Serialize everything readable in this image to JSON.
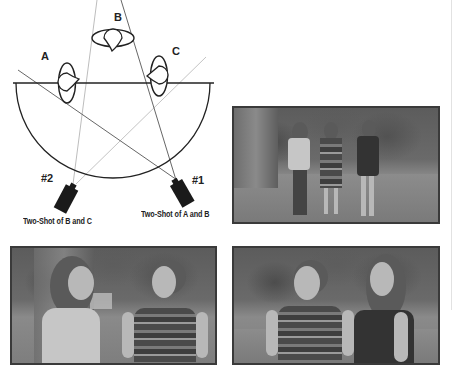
{
  "diagram": {
    "people": [
      {
        "id": "A",
        "label": "A"
      },
      {
        "id": "B",
        "label": "B"
      },
      {
        "id": "C",
        "label": "C"
      }
    ],
    "cameras": [
      {
        "id": "cam1",
        "label": "#1",
        "caption": "Two-Shot of A and B"
      },
      {
        "id": "cam2",
        "label": "#2",
        "caption": "Two-Shot of B and C"
      }
    ],
    "elements": {
      "axis_line": "180-degree line",
      "arc": "camera placement semicircle"
    }
  },
  "photos": [
    {
      "id": "photo-three",
      "description": "Wide shot of three women A, B, C standing on a lawn"
    },
    {
      "id": "photo-bc-left",
      "description": "Two-shot: woman in light shirt facing woman in striped top"
    },
    {
      "id": "photo-bc-right",
      "description": "Two-shot: woman in striped top with woman in dark top behind"
    }
  ],
  "colors": {
    "line_dark": "#333333",
    "line_light": "#bbbbbb",
    "camera": "#1a1a1a",
    "photo_border": "#3a3a3a"
  }
}
